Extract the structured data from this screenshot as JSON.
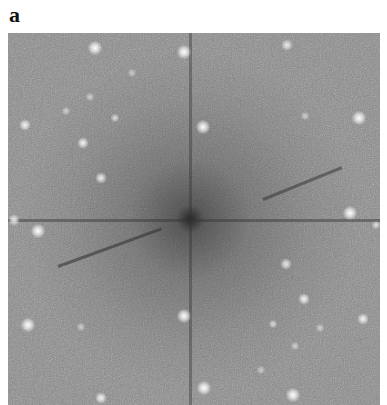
{
  "figure": {
    "panel_label": "a",
    "image_description": "Fourier transform / diffraction pattern with bright spots on noisy gray background, dark central region and cross streaks",
    "colors": {
      "background": "#8a8a8a",
      "spot": "#ffffff",
      "label": "#111111"
    },
    "spots": [
      {
        "x": 87,
        "y": 15,
        "r": 5,
        "i": 1.0
      },
      {
        "x": 176,
        "y": 19,
        "r": 5,
        "i": 1.0
      },
      {
        "x": 279,
        "y": 12,
        "r": 4,
        "i": 0.8
      },
      {
        "x": 124,
        "y": 40,
        "r": 3,
        "i": 0.5
      },
      {
        "x": 82,
        "y": 64,
        "r": 3,
        "i": 0.55
      },
      {
        "x": 58,
        "y": 78,
        "r": 3,
        "i": 0.55
      },
      {
        "x": 107,
        "y": 85,
        "r": 3,
        "i": 0.7
      },
      {
        "x": 17,
        "y": 92,
        "r": 4,
        "i": 0.9
      },
      {
        "x": 195,
        "y": 94,
        "r": 5,
        "i": 1.0
      },
      {
        "x": 297,
        "y": 83,
        "r": 3,
        "i": 0.55
      },
      {
        "x": 351,
        "y": 85,
        "r": 5,
        "i": 1.0
      },
      {
        "x": 75,
        "y": 110,
        "r": 4,
        "i": 0.9
      },
      {
        "x": 93,
        "y": 145,
        "r": 4,
        "i": 0.85
      },
      {
        "x": 342,
        "y": 180,
        "r": 5,
        "i": 1.0
      },
      {
        "x": 6,
        "y": 187,
        "r": 4,
        "i": 0.85
      },
      {
        "x": 30,
        "y": 198,
        "r": 5,
        "i": 1.0
      },
      {
        "x": 368,
        "y": 192,
        "r": 3,
        "i": 0.7
      },
      {
        "x": 278,
        "y": 231,
        "r": 4,
        "i": 0.8
      },
      {
        "x": 296,
        "y": 266,
        "r": 4,
        "i": 0.9
      },
      {
        "x": 176,
        "y": 283,
        "r": 5,
        "i": 1.0
      },
      {
        "x": 20,
        "y": 292,
        "r": 5,
        "i": 1.0
      },
      {
        "x": 73,
        "y": 294,
        "r": 3,
        "i": 0.55
      },
      {
        "x": 265,
        "y": 291,
        "r": 3,
        "i": 0.65
      },
      {
        "x": 312,
        "y": 295,
        "r": 3,
        "i": 0.55
      },
      {
        "x": 355,
        "y": 286,
        "r": 4,
        "i": 0.9
      },
      {
        "x": 287,
        "y": 313,
        "r": 3,
        "i": 0.55
      },
      {
        "x": 253,
        "y": 337,
        "r": 3,
        "i": 0.5
      },
      {
        "x": 196,
        "y": 355,
        "r": 5,
        "i": 1.0
      },
      {
        "x": 285,
        "y": 362,
        "r": 5,
        "i": 1.0
      },
      {
        "x": 93,
        "y": 365,
        "r": 4,
        "i": 0.9
      }
    ]
  }
}
